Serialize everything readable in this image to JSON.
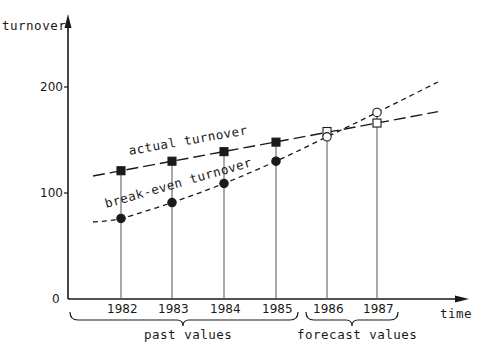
{
  "chart_data": {
    "type": "line",
    "title": "",
    "xlabel": "time",
    "ylabel": "turnover",
    "categories": [
      "1982",
      "1983",
      "1984",
      "1985",
      "1986",
      "1987"
    ],
    "series": [
      {
        "name": "actual turnover",
        "marker": "square",
        "values": [
          121,
          130,
          139,
          148,
          158,
          166
        ],
        "filled": [
          true,
          true,
          true,
          true,
          false,
          false
        ],
        "line_style": "long-dash"
      },
      {
        "name": "break-even turnover",
        "marker": "circle",
        "values": [
          76,
          91,
          109,
          130,
          153,
          176
        ],
        "filled": [
          true,
          true,
          true,
          true,
          false,
          false
        ],
        "line_style": "short-dash"
      }
    ],
    "yticks": [
      "0",
      "100",
      "200"
    ],
    "ylim": [
      0,
      200
    ],
    "grid": false,
    "annotations": [
      {
        "text": "past values",
        "span": [
          "1982",
          "1985"
        ]
      },
      {
        "text": "forecast values",
        "span": [
          "1986",
          "1987"
        ]
      }
    ]
  },
  "axes": {
    "y_label": "turnover",
    "x_label": "time",
    "y_ticks": [
      {
        "label": "0",
        "value": 0
      },
      {
        "label": "100",
        "value": 100
      },
      {
        "label": "200",
        "value": 200
      }
    ],
    "x_ticks": [
      "1982",
      "1983",
      "1984",
      "1985",
      "1986",
      "1987"
    ]
  },
  "labels": {
    "actual": "actual turnover",
    "break_even": "break-even turnover",
    "past": "past values",
    "forecast": "forecast values"
  },
  "colors": {
    "ink": "#1a1a1a",
    "drop_line": "#555555",
    "background": "#ffffff"
  }
}
